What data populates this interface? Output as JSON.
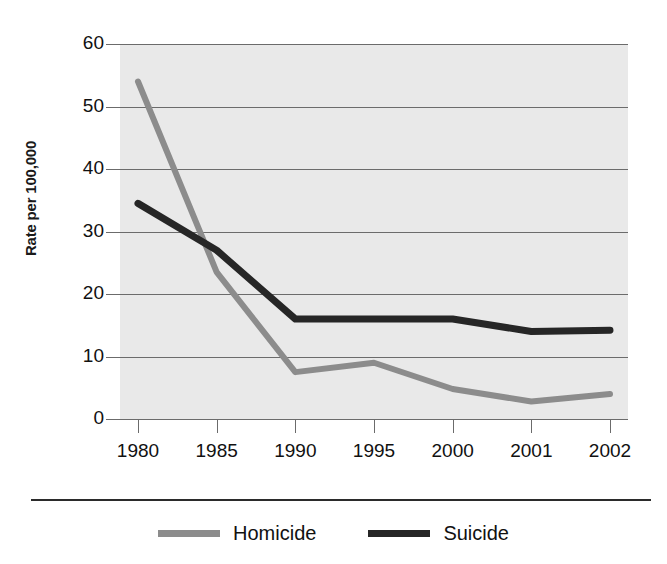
{
  "chart_data": {
    "type": "line",
    "title": "",
    "subtitle": "",
    "xlabel": "",
    "ylabel": "Rate per 100,000",
    "categories": [
      "1980",
      "1985",
      "1990",
      "1995",
      "2000",
      "2001",
      "2002"
    ],
    "series": [
      {
        "name": "Homicide",
        "color": "#8c8c8c",
        "values": [
          54,
          23.5,
          7.5,
          9,
          4.8,
          2.8,
          4
        ]
      },
      {
        "name": "Suicide",
        "color": "#262626",
        "values": [
          34.5,
          27,
          16,
          16,
          16,
          14,
          14.2
        ]
      }
    ],
    "ylim": [
      0,
      60
    ],
    "yticks": [
      "0",
      "10",
      "20",
      "30",
      "40",
      "50",
      "60"
    ],
    "ytick_values": [
      0,
      10,
      20,
      30,
      40,
      50,
      60
    ],
    "grid": true,
    "grid_axis": "y",
    "legend_position": "bottom",
    "plot_background": "#e9e9e9",
    "grid_color": "#6b6b6b",
    "axis_color": "#6b6b6b"
  },
  "legend": {
    "entries": [
      {
        "label": "Homicide",
        "color": "#8c8c8c"
      },
      {
        "label": "Suicide",
        "color": "#262626"
      }
    ]
  }
}
